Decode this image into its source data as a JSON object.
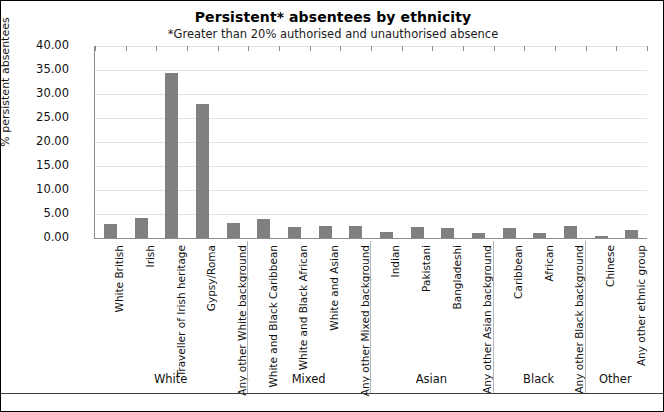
{
  "chart_data": {
    "type": "bar",
    "title": "Persistent* absentees by ethnicity",
    "subtitle": "*Greater than 20% authorised and unauthorised absence",
    "xlabel": "",
    "ylabel": "% persistent absentees",
    "ylim": [
      0,
      40
    ],
    "ytick_step": 5,
    "ytick_labels": [
      "0.00",
      "5.00",
      "10.00",
      "15.00",
      "20.00",
      "25.00",
      "30.00",
      "35.00",
      "40.00"
    ],
    "ytick_values": [
      0,
      5,
      10,
      15,
      20,
      25,
      30,
      35,
      40
    ],
    "grid": true,
    "legend": "none",
    "bar_color": "#808080",
    "categories": [
      "White British",
      "Irish",
      "Traveller of Irish heritage",
      "Gypsy/Roma",
      "Any other White background",
      "White and Black Caribbean",
      "White and Black African",
      "White and Asian",
      "Any other Mixed background",
      "Indian",
      "Pakistani",
      "Bangladeshi",
      "Any other Asian background",
      "Caribbean",
      "African",
      "Any other Black background",
      "Chinese",
      "Any other ethnic group"
    ],
    "values": [
      3.0,
      4.1,
      34.3,
      27.9,
      3.1,
      4.0,
      2.3,
      2.4,
      2.5,
      1.2,
      2.2,
      2.1,
      1.1,
      2.0,
      1.0,
      2.5,
      0.4,
      1.6
    ],
    "groups": [
      {
        "label": "White",
        "start": 0,
        "end": 4
      },
      {
        "label": "Mixed",
        "start": 5,
        "end": 8
      },
      {
        "label": "Asian",
        "start": 9,
        "end": 12
      },
      {
        "label": "Black",
        "start": 13,
        "end": 15
      },
      {
        "label": "Other",
        "start": 16,
        "end": 17
      }
    ]
  }
}
